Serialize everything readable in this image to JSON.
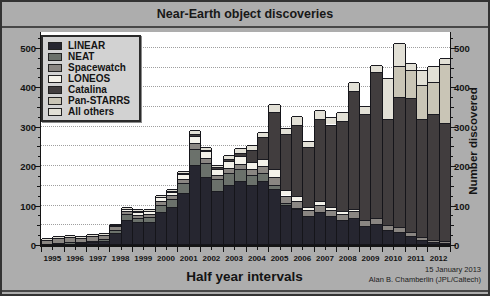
{
  "chart_data": {
    "type": "bar",
    "stacked": true,
    "title": "Near-Earth object discoveries",
    "xlabel": "Half year intervals",
    "ylabel_right": "Number discovered",
    "credit_line1": "15 January 2013",
    "credit_line2": "Alan B. Chamberlin (JPL/Caltech)",
    "ylim": [
      0,
      540
    ],
    "yticks": [
      0,
      100,
      200,
      300,
      400,
      500
    ],
    "minor_tick_step": 25,
    "gridline_step": 50,
    "grid": "dotted-horizontal",
    "legend_position": "top-left",
    "years": [
      "1995",
      "1996",
      "1997",
      "1998",
      "1999",
      "2000",
      "2001",
      "2002",
      "2003",
      "2004",
      "2005",
      "2006",
      "2007",
      "2008",
      "2009",
      "2010",
      "2011",
      "2012"
    ],
    "categories": [
      "1995 H1",
      "1995 H2",
      "1996 H1",
      "1996 H2",
      "1997 H1",
      "1997 H2",
      "1998 H1",
      "1998 H2",
      "1999 H1",
      "1999 H2",
      "2000 H1",
      "2000 H2",
      "2001 H1",
      "2001 H2",
      "2002 H1",
      "2002 H2",
      "2003 H1",
      "2003 H2",
      "2004 H1",
      "2004 H2",
      "2005 H1",
      "2005 H2",
      "2006 H1",
      "2006 H2",
      "2007 H1",
      "2007 H2",
      "2008 H1",
      "2008 H2",
      "2009 H1",
      "2009 H2",
      "2010 H1",
      "2010 H2",
      "2011 H1",
      "2011 H2",
      "2012 H1",
      "2012 H2"
    ],
    "series": [
      {
        "name": "LINEAR",
        "color": "#262630",
        "values": [
          0,
          0,
          1,
          2,
          4,
          8,
          28,
          60,
          55,
          56,
          82,
          95,
          130,
          200,
          170,
          135,
          150,
          160,
          150,
          160,
          140,
          100,
          90,
          70,
          80,
          70,
          60,
          65,
          45,
          50,
          35,
          30,
          20,
          10,
          5,
          2
        ]
      },
      {
        "name": "NEAT",
        "color": "#6b716b",
        "values": [
          1,
          3,
          4,
          3,
          4,
          4,
          8,
          15,
          12,
          12,
          18,
          20,
          25,
          40,
          35,
          30,
          30,
          30,
          25,
          20,
          10,
          5,
          2,
          0,
          0,
          0,
          0,
          0,
          0,
          0,
          0,
          0,
          0,
          0,
          0,
          0
        ]
      },
      {
        "name": "Spacewatch",
        "color": "#8a8682",
        "values": [
          9,
          12,
          13,
          11,
          12,
          11,
          9,
          8,
          7,
          7,
          8,
          8,
          10,
          15,
          12,
          10,
          12,
          14,
          16,
          18,
          20,
          18,
          18,
          15,
          18,
          15,
          15,
          18,
          15,
          15,
          12,
          12,
          10,
          8,
          5,
          5
        ]
      },
      {
        "name": "LONEOS",
        "color": "#f4f2ea",
        "values": [
          0,
          0,
          0,
          0,
          0,
          0,
          2,
          7,
          8,
          8,
          10,
          10,
          12,
          20,
          18,
          15,
          18,
          18,
          18,
          18,
          20,
          15,
          12,
          10,
          10,
          8,
          8,
          6,
          0,
          0,
          0,
          0,
          0,
          0,
          0,
          0
        ]
      },
      {
        "name": "Catalina",
        "color": "#413d3e",
        "values": [
          0,
          0,
          0,
          0,
          0,
          0,
          0,
          0,
          1,
          1,
          2,
          2,
          3,
          5,
          4,
          4,
          6,
          10,
          30,
          55,
          145,
          140,
          180,
          150,
          210,
          210,
          230,
          300,
          270,
          370,
          270,
          330,
          340,
          300,
          320,
          300
        ]
      },
      {
        "name": "Pan-STARRS",
        "color": "#c9c5b6",
        "values": [
          0,
          0,
          0,
          0,
          0,
          0,
          0,
          0,
          0,
          0,
          0,
          0,
          0,
          0,
          0,
          0,
          0,
          0,
          0,
          0,
          0,
          0,
          0,
          0,
          0,
          0,
          0,
          0,
          0,
          0,
          0,
          80,
          70,
          85,
          80,
          150
        ]
      },
      {
        "name": "All others",
        "color": "#e2e0d6",
        "values": [
          4,
          6,
          6,
          5,
          6,
          6,
          5,
          5,
          5,
          5,
          5,
          5,
          5,
          8,
          7,
          7,
          9,
          11,
          13,
          14,
          20,
          17,
          23,
          17,
          22,
          19,
          21,
          23,
          20,
          20,
          103,
          58,
          20,
          37,
          42,
          15
        ]
      }
    ]
  },
  "colors": {
    "figure_background": "#adadad",
    "plot_background": "#ffffff",
    "frame": "#333333",
    "axis": "#141414",
    "gridline": "#9f9f9f",
    "legend_background": "#d2d2d2",
    "text": "#141414"
  }
}
